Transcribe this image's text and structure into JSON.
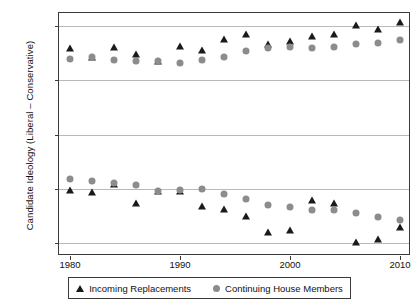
{
  "chart_data": {
    "type": "scatter",
    "title": "",
    "xlabel": "",
    "ylabel": "Candidate Ideology (Liberal – Conservative)",
    "xlim": [
      1979,
      2011
    ],
    "ylim": [
      -1.12,
      1.12
    ],
    "grid": true,
    "gridlines_y": [
      1,
      0.5,
      0,
      -0.5,
      -1
    ],
    "xticks": [
      1980,
      1990,
      2000,
      2010
    ],
    "xtick_labels": [
      "1980",
      "1990",
      "2000",
      "2010"
    ],
    "yticks": [
      1,
      0.5,
      0,
      -0.5,
      -1
    ],
    "ytick_labels": [
      "1",
      "0.5",
      "0",
      "−0.5",
      "−1"
    ],
    "legend_position": "below-center",
    "x": [
      1980,
      1982,
      1984,
      1986,
      1988,
      1990,
      1992,
      1994,
      1996,
      1998,
      2000,
      2002,
      2004,
      2006,
      2008,
      2010
    ],
    "series": [
      {
        "name": "Incoming Replacements",
        "marker": "triangle",
        "color": "#1a1a1a",
        "groups": [
          {
            "label": "conservative",
            "values": [
              0.8,
              0.71,
              0.81,
              0.74,
              0.68,
              0.82,
              0.78,
              0.88,
              0.93,
              0.83,
              0.86,
              0.91,
              0.93,
              1.01,
              0.97,
              1.04
            ]
          },
          {
            "label": "liberal",
            "values": [
              -0.51,
              -0.53,
              -0.46,
              -0.63,
              -0.52,
              -0.52,
              -0.66,
              -0.69,
              -0.75,
              -0.9,
              -0.88,
              -0.6,
              -0.63,
              -0.99,
              -0.96,
              -0.85
            ]
          }
        ]
      },
      {
        "name": "Continuing House Members",
        "marker": "circle",
        "color": "#8c8c8c",
        "groups": [
          {
            "label": "conservative",
            "values": [
              0.7,
              0.71,
              0.69,
              0.68,
              0.68,
              0.66,
              0.69,
              0.71,
              0.77,
              0.8,
              0.81,
              0.8,
              0.81,
              0.83,
              0.84,
              0.87
            ]
          },
          {
            "label": "liberal",
            "values": [
              -0.41,
              -0.43,
              -0.45,
              -0.47,
              -0.52,
              -0.51,
              -0.5,
              -0.55,
              -0.59,
              -0.65,
              -0.67,
              -0.7,
              -0.7,
              -0.72,
              -0.76,
              -0.79
            ]
          }
        ]
      }
    ]
  },
  "legend": {
    "entries": [
      {
        "label": "Incoming Replacements",
        "marker": "triangle-marker-icon"
      },
      {
        "label": "Continuing House Members",
        "marker": "circle-marker-icon"
      }
    ]
  },
  "colors": {
    "incoming": "#1a1a1a",
    "continuing": "#8c8c8c",
    "grid": "#b9b9b9",
    "axis": "#3a3a3a"
  }
}
